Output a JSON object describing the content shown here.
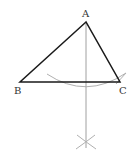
{
  "diagram": {
    "type": "geometric-construction",
    "points": {
      "A": {
        "label": "A",
        "x": 86,
        "y": 22
      },
      "B": {
        "label": "B",
        "x": 20,
        "y": 82
      },
      "C": {
        "label": "C",
        "x": 120,
        "y": 82
      }
    },
    "labels": {
      "a": "A",
      "b": "B",
      "c": "C"
    },
    "colors": {
      "triangle": "#1a1a1a",
      "construction": "#a8a8a8",
      "label": "#333333"
    }
  }
}
